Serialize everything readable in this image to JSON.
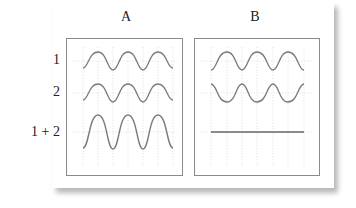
{
  "columns": [
    {
      "label": "A"
    },
    {
      "label": "B"
    }
  ],
  "rows": [
    {
      "label": "1"
    },
    {
      "label": "2"
    },
    {
      "label": "1 + 2"
    }
  ],
  "panels": {
    "A": {
      "description": "Constructive interference: waves 1 and 2 in phase, sum has double amplitude",
      "traces": [
        {
          "row": "1",
          "phase": "in-phase",
          "amplitude": 1
        },
        {
          "row": "2",
          "phase": "in-phase",
          "amplitude": 1
        },
        {
          "row": "1 + 2",
          "phase": "in-phase",
          "amplitude": 2
        }
      ]
    },
    "B": {
      "description": "Destructive interference: waves 1 and 2 out of phase, sum is a flat line",
      "traces": [
        {
          "row": "1",
          "phase": "0",
          "amplitude": 1
        },
        {
          "row": "2",
          "phase": "180",
          "amplitude": 1
        },
        {
          "row": "1 + 2",
          "phase": "flat",
          "amplitude": 0
        }
      ]
    }
  },
  "colors": {
    "trace": "#7a7a7a",
    "flat_trace": "#666666",
    "grid": "#d8d8d8",
    "border": "#8a8a8a",
    "text": "#222222"
  }
}
